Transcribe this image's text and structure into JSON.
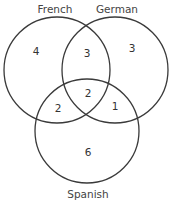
{
  "diagram": {
    "type": "venn-3",
    "sets": [
      {
        "name": "French",
        "label": "French"
      },
      {
        "name": "German",
        "label": "German"
      },
      {
        "name": "Spanish",
        "label": "Spanish"
      }
    ],
    "regions": {
      "french_only": "4",
      "german_only": "3",
      "spanish_only": "6",
      "french_german_only": "3",
      "french_spanish_only": "2",
      "german_spanish_only": "1",
      "all_three": "2"
    },
    "colors": {
      "stroke": "#3a3a3a",
      "text": "#444444",
      "background": "#ffffff"
    }
  }
}
